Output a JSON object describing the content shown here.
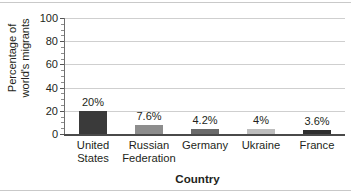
{
  "chart_data": {
    "type": "bar",
    "title": "",
    "xlabel": "Country",
    "ylabel": "Percentage of world's migrants",
    "ylabel_lines": [
      "Percentage of",
      "world's migrants"
    ],
    "categories": [
      "United States",
      "Russian Federation",
      "Germany",
      "Ukraine",
      "France"
    ],
    "category_lines": [
      [
        "United",
        "States"
      ],
      [
        "Russian",
        "Federation"
      ],
      [
        "Germany"
      ],
      [
        "Ukraine"
      ],
      [
        "France"
      ]
    ],
    "values": [
      20,
      7.6,
      4.2,
      4,
      3.6
    ],
    "data_labels": [
      "20%",
      "7.6%",
      "4.2%",
      "4%",
      "3.6%"
    ],
    "bar_colors": [
      "#3a3a3a",
      "#8d8d8d",
      "#6b6b6b",
      "#bdbdbd",
      "#2f2f2f"
    ],
    "ylim": [
      0,
      100
    ],
    "yticks": [
      0,
      20,
      40,
      60,
      80,
      100
    ],
    "ytick_labels": [
      "0",
      "20",
      "40",
      "60",
      "80",
      "100"
    ],
    "yminor_step": 5,
    "grid": true,
    "grid_axis": "y",
    "legend": false,
    "legend_position": "none",
    "axis_color": "#4a4a4a",
    "grid_color": "#cfcfcf",
    "text_color": "#231f20",
    "background": "#ffffff"
  }
}
